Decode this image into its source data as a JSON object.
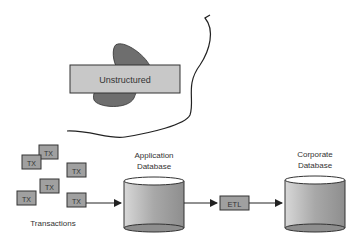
{
  "diagram": {
    "unstructured": {
      "label": "Unstructured"
    },
    "transactions": {
      "label": "Transactions",
      "items": [
        "TX",
        "TX",
        "TX",
        "TX",
        "TX",
        "TX"
      ]
    },
    "application_db": {
      "line1": "Application",
      "line2": "Database"
    },
    "etl": {
      "label": "ETL"
    },
    "corporate_db": {
      "line1": "Corporate",
      "line2": "Database"
    }
  },
  "colors": {
    "box_fill": "#c8c8c8",
    "blob_fill": "#6e6e6e",
    "line": "#222222",
    "db_fill": "#b0b0b0"
  }
}
